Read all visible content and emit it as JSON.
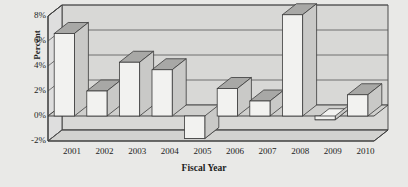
{
  "chart_data": {
    "type": "bar",
    "title": "",
    "subtitle": "",
    "xlabel": "Fiscal Year",
    "ylabel": "Percent",
    "categories": [
      "2001",
      "2002",
      "2003",
      "2004",
      "2005",
      "2006",
      "2007",
      "2008",
      "2009",
      "2010"
    ],
    "values": [
      6.6,
      2.0,
      4.3,
      3.7,
      -1.8,
      2.2,
      1.2,
      8.1,
      -0.3,
      1.7
    ],
    "value_unit": "%",
    "ylim": [
      -2,
      8
    ],
    "yticks": [
      "-2%",
      "0%",
      "2%",
      "4%",
      "6%",
      "8%"
    ],
    "ytick_values": [
      -2,
      0,
      2,
      4,
      6,
      8
    ],
    "grid": true,
    "gridlines_horizontal": true,
    "legend": false,
    "legend_position": "none",
    "style": "3d-column",
    "series": [
      {
        "name": "Percent",
        "values": [
          6.6,
          2.0,
          4.3,
          3.7,
          -1.8,
          2.2,
          1.2,
          8.1,
          -0.3,
          1.7
        ]
      }
    ]
  },
  "colors": {
    "page_background": "#e9e9e7",
    "plot_background": "#d8d8d6",
    "bar_face": "#f2f2f0",
    "bar_top": "#a8a8a6",
    "bar_side": "#c9c9c7",
    "axis_line": "#3a3a3a",
    "gridline": "#555555",
    "text": "#1d1d1d"
  }
}
